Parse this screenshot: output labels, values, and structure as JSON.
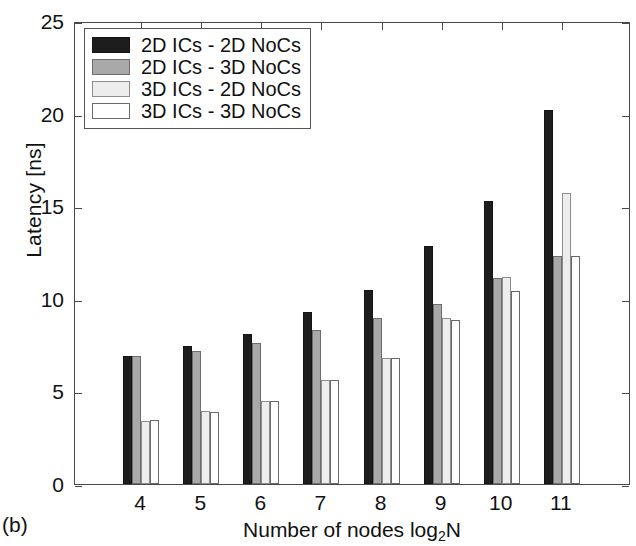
{
  "figure": {
    "panel_caption": "(b)"
  },
  "chart_data": {
    "type": "bar",
    "title": "",
    "xlabel": "Number of nodes log2N",
    "xlabel_base": "Number of nodes log",
    "xlabel_sub": "2",
    "xlabel_tail": "N",
    "ylabel": "Latency [ns]",
    "categories": [
      "4",
      "5",
      "6",
      "7",
      "8",
      "9",
      "10",
      "11"
    ],
    "ylim": [
      0,
      25
    ],
    "yticks": [
      "0",
      "5",
      "10",
      "15",
      "20",
      "25"
    ],
    "ytick_values": [
      0,
      5,
      10,
      15,
      20,
      25
    ],
    "grid": false,
    "legend_position": "top-left",
    "series": [
      {
        "name": "2D ICs - 2D NoCs",
        "color": "#1d1d1d",
        "values": [
          6.9,
          7.45,
          8.1,
          9.3,
          10.5,
          12.85,
          15.3,
          20.2
        ]
      },
      {
        "name": "2D ICs - 3D NoCs",
        "color": "#a9a9a9",
        "values": [
          6.9,
          7.2,
          7.6,
          8.3,
          8.95,
          9.7,
          11.1,
          12.3
        ]
      },
      {
        "name": "3D ICs - 2D NoCs",
        "color": "#ededed",
        "values": [
          3.4,
          3.95,
          4.5,
          5.6,
          6.8,
          8.95,
          11.2,
          15.7
        ]
      },
      {
        "name": "3D ICs - 3D NoCs",
        "color": "#ffffff",
        "values": [
          3.45,
          3.9,
          4.5,
          5.6,
          6.8,
          8.85,
          10.4,
          12.3
        ]
      }
    ]
  }
}
